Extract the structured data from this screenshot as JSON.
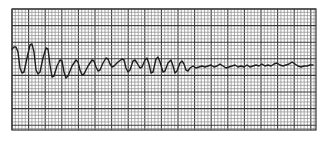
{
  "figure": {
    "grid": {
      "x0": 12,
      "y0": 9,
      "x1": 316,
      "y1": 130,
      "minor_spacing": 3.32,
      "major_every": 5,
      "minor_color": "#8a8a8a",
      "major_color": "#3a3a3a",
      "border_color": "#333333"
    },
    "trace": {
      "color": "#1e1e1e",
      "width": 1.4,
      "points": [
        [
          12,
          49
        ],
        [
          14,
          47
        ],
        [
          16,
          47
        ],
        [
          18,
          52
        ],
        [
          20,
          68
        ],
        [
          22,
          73
        ],
        [
          24,
          72
        ],
        [
          27,
          58
        ],
        [
          30,
          45
        ],
        [
          32,
          44
        ],
        [
          34,
          52
        ],
        [
          36,
          70
        ],
        [
          38,
          74
        ],
        [
          40,
          72
        ],
        [
          43,
          58
        ],
        [
          46,
          48
        ],
        [
          48,
          49
        ],
        [
          50,
          65
        ],
        [
          52,
          77
        ],
        [
          54,
          76
        ],
        [
          57,
          66
        ],
        [
          60,
          60
        ],
        [
          62,
          61
        ],
        [
          64,
          72
        ],
        [
          66,
          78
        ],
        [
          68,
          76
        ],
        [
          72,
          66
        ],
        [
          76,
          60
        ],
        [
          78,
          62
        ],
        [
          80,
          70
        ],
        [
          82,
          75
        ],
        [
          84,
          74
        ],
        [
          88,
          66
        ],
        [
          92,
          60
        ],
        [
          94,
          61
        ],
        [
          96,
          67
        ],
        [
          98,
          71
        ],
        [
          100,
          70
        ],
        [
          103,
          63
        ],
        [
          106,
          58
        ],
        [
          108,
          59
        ],
        [
          110,
          64
        ],
        [
          112,
          67
        ],
        [
          114,
          66
        ],
        [
          118,
          62
        ],
        [
          122,
          59
        ],
        [
          124,
          60
        ],
        [
          126,
          68
        ],
        [
          128,
          72
        ],
        [
          130,
          70
        ],
        [
          133,
          61
        ],
        [
          135,
          60
        ],
        [
          137,
          63
        ],
        [
          140,
          68
        ],
        [
          142,
          67
        ],
        [
          145,
          60
        ],
        [
          147,
          58
        ],
        [
          149,
          64
        ],
        [
          151,
          73
        ],
        [
          153,
          72
        ],
        [
          156,
          59
        ],
        [
          158,
          57
        ],
        [
          160,
          62
        ],
        [
          163,
          72
        ],
        [
          165,
          71
        ],
        [
          168,
          63
        ],
        [
          171,
          60
        ],
        [
          173,
          66
        ],
        [
          175,
          73
        ],
        [
          177,
          71
        ],
        [
          180,
          63
        ],
        [
          182,
          61
        ],
        [
          184,
          64
        ],
        [
          186,
          70
        ],
        [
          188,
          71
        ],
        [
          190,
          68
        ],
        [
          193,
          66
        ],
        [
          196,
          68
        ],
        [
          199,
          67
        ],
        [
          202,
          66
        ],
        [
          205,
          67
        ],
        [
          208,
          66
        ],
        [
          211,
          65
        ],
        [
          214,
          67
        ],
        [
          217,
          66
        ],
        [
          220,
          64
        ],
        [
          223,
          66
        ],
        [
          226,
          68
        ],
        [
          229,
          67
        ],
        [
          232,
          66
        ],
        [
          235,
          65
        ],
        [
          238,
          67
        ],
        [
          241,
          66
        ],
        [
          244,
          67
        ],
        [
          247,
          65
        ],
        [
          250,
          67
        ],
        [
          253,
          66
        ],
        [
          256,
          65
        ],
        [
          259,
          66
        ],
        [
          262,
          64
        ],
        [
          265,
          66
        ],
        [
          268,
          65
        ],
        [
          271,
          66
        ],
        [
          274,
          64
        ],
        [
          277,
          63
        ],
        [
          280,
          65
        ],
        [
          283,
          66
        ],
        [
          286,
          65
        ],
        [
          289,
          64
        ],
        [
          292,
          62
        ],
        [
          295,
          64
        ],
        [
          298,
          66
        ],
        [
          301,
          67
        ],
        [
          304,
          66
        ],
        [
          307,
          66
        ],
        [
          310,
          65
        ],
        [
          313,
          65
        ]
      ]
    }
  }
}
